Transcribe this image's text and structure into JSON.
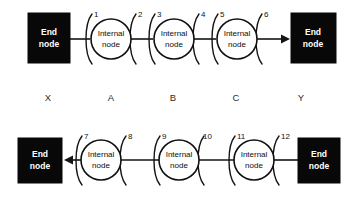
{
  "diagram": {
    "colors": {
      "end_node_fill": "#080808",
      "end_node_text": "#ffffff",
      "internal_node_fill": "#ffffff",
      "stroke": "#141414",
      "label_text": "#2b2b2b",
      "background": "#ffffff"
    },
    "labels": {
      "end_node": "End\nnode",
      "end_node_line1": "End",
      "end_node_line2": "node",
      "internal_node_line1": "Internal",
      "internal_node_line2": "node"
    },
    "system_labels": [
      {
        "text": "X",
        "x": 48
      },
      {
        "text": "A",
        "x": 110
      },
      {
        "text": "B",
        "x": 172
      },
      {
        "text": "C",
        "x": 235
      },
      {
        "text": "Y",
        "x": 300
      }
    ],
    "rows": [
      {
        "name": "top-row",
        "direction": "left-to-right",
        "arrow_at": "right",
        "end_nodes": [
          {
            "name": "end-node-left",
            "label_line1": "End",
            "label_line2": "node",
            "x": 28,
            "y": 13,
            "w": 42,
            "h": 50
          },
          {
            "name": "end-node-right",
            "label_line1": "End",
            "label_line2": "node",
            "x": 290,
            "y": 13,
            "w": 46,
            "h": 50
          }
        ],
        "internal_nodes": [
          {
            "name": "internal-node-a",
            "label_line1": "Internal",
            "label_line2": "node",
            "cx": 110,
            "cy": 39,
            "r": 20
          },
          {
            "name": "internal-node-b",
            "label_line1": "Internal",
            "label_line2": "node",
            "cx": 173,
            "cy": 39,
            "r": 20
          },
          {
            "name": "internal-node-c",
            "label_line1": "Internal",
            "label_line2": "node",
            "cx": 236,
            "cy": 39,
            "r": 20
          }
        ],
        "ports": [
          {
            "number": "1",
            "arc_x": 88,
            "label_x": 92,
            "label_y": 16
          },
          {
            "number": "2",
            "arc_x": 132,
            "label_x": 136,
            "label_y": 16
          },
          {
            "number": "3",
            "arc_x": 151,
            "label_x": 155,
            "label_y": 16
          },
          {
            "number": "4",
            "arc_x": 195,
            "label_x": 199,
            "label_y": 16
          },
          {
            "number": "5",
            "arc_x": 214,
            "label_x": 218,
            "label_y": 16
          },
          {
            "number": "6",
            "arc_x": 258,
            "label_x": 262,
            "label_y": 16
          }
        ]
      },
      {
        "name": "bottom-row",
        "direction": "right-to-left",
        "arrow_at": "left",
        "end_nodes": [
          {
            "name": "end-node-left",
            "label_line1": "End",
            "label_line2": "node",
            "x": 18,
            "y": 138,
            "w": 44,
            "h": 45
          },
          {
            "name": "end-node-right",
            "label_line1": "End",
            "label_line2": "node",
            "x": 298,
            "y": 138,
            "w": 42,
            "h": 45
          }
        ],
        "internal_nodes": [
          {
            "name": "internal-node-a",
            "label_line1": "Internal",
            "label_line2": "node",
            "cx": 100,
            "cy": 160,
            "r": 20
          },
          {
            "name": "internal-node-b",
            "label_line1": "Internal",
            "label_line2": "node",
            "cx": 178,
            "cy": 160,
            "r": 20
          },
          {
            "name": "internal-node-c",
            "label_line1": "Internal",
            "label_line2": "node",
            "cx": 253,
            "cy": 160,
            "r": 20
          }
        ],
        "ports": [
          {
            "number": "7",
            "arc_x": 78,
            "label_x": 82,
            "label_y": 137
          },
          {
            "number": "8",
            "arc_x": 122,
            "label_x": 126,
            "label_y": 137
          },
          {
            "number": "9",
            "arc_x": 156,
            "label_x": 160,
            "label_y": 137
          },
          {
            "number": "10",
            "arc_x": 200,
            "label_x": 202,
            "label_y": 137
          },
          {
            "number": "11",
            "arc_x": 231,
            "label_x": 235,
            "label_y": 137
          },
          {
            "number": "12",
            "arc_x": 275,
            "label_x": 279,
            "label_y": 137
          }
        ]
      }
    ]
  }
}
